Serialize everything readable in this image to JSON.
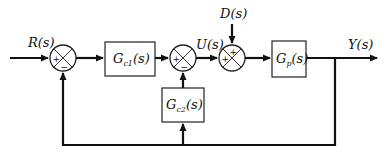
{
  "diagram": {
    "type": "block-diagram",
    "signals": {
      "reference": "R(s)",
      "control": "U(s)",
      "disturbance": "D(s)",
      "output": "Y(s)"
    },
    "blocks": {
      "gc1": {
        "main": "G",
        "sub": "c1",
        "arg": "(s)"
      },
      "gc2": {
        "main": "G",
        "sub": "c2",
        "arg": "(s)"
      },
      "gp": {
        "main": "G",
        "sub": "p",
        "arg": "(s)"
      }
    },
    "summing_junctions": {
      "sum1": {
        "top_left_sign": "+",
        "bottom_sign": "−"
      },
      "sum2": {
        "left_sign": "+",
        "bottom_sign": "−"
      },
      "sum3": {
        "top_sign": "+",
        "left_sign": "+"
      }
    },
    "colors": {
      "line": "#111111",
      "background": "#ffffff"
    }
  }
}
